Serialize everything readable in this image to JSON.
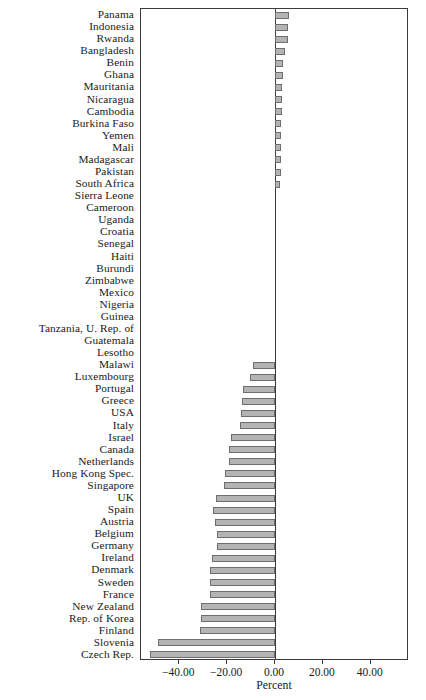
{
  "chart_data": {
    "type": "bar",
    "orientation": "horizontal",
    "title": "",
    "xlabel": "Percent",
    "ylabel": "",
    "xlim": [
      -56,
      56
    ],
    "xticks": [
      -40,
      -20,
      0,
      20,
      40
    ],
    "xticklabels": [
      "−40.00",
      "−20.00",
      "0.00",
      "20.00",
      "40.00"
    ],
    "grid": false,
    "legend": null,
    "bar_color": "#b4b4b4",
    "bar_edge_color": "#6e6e6e",
    "axis_color": "#3a3a3a",
    "categories": [
      "Panama",
      "Indonesia",
      "Rwanda",
      "Bangladesh",
      "Benin",
      "Ghana",
      "Mauritania",
      "Nicaragua",
      "Cambodia",
      "Burkina Faso",
      "Yemen",
      "Mali",
      "Madagascar",
      "Pakistan",
      "South Africa",
      "Sierra Leone",
      "Cameroon",
      "Uganda",
      "Croatia",
      "Senegal",
      "Haiti",
      "Burundi",
      "Zimbabwe",
      "Mexico",
      "Nigeria",
      "Guinea",
      "Tanzania, U. Rep. of",
      "Guatemala",
      "Lesotho",
      "Malawi",
      "Luxembourg",
      "Portugal",
      "Greece",
      "USA",
      "Italy",
      "Israel",
      "Canada",
      "Netherlands",
      "Hong Kong Spec.",
      "Singapore",
      "UK",
      "Spain",
      "Austria",
      "Belgium",
      "Germany",
      "Ireland",
      "Denmark",
      "Sweden",
      "France",
      "New Zealand",
      "Rep. of Korea",
      "Finland",
      "Slovenia",
      "Czech Rep."
    ],
    "values": [
      6.0,
      5.6,
      5.6,
      4.2,
      3.4,
      3.2,
      3.0,
      2.9,
      2.8,
      2.7,
      2.6,
      2.5,
      2.4,
      2.3,
      2.2,
      0.0,
      0.0,
      0.0,
      0.0,
      0.0,
      0.0,
      0.0,
      0.0,
      0.0,
      0.0,
      0.0,
      0.0,
      0.0,
      0.0,
      -9.0,
      -10.6,
      -13.4,
      -14.0,
      -14.4,
      -14.8,
      -18.5,
      -19.2,
      -19.4,
      -20.8,
      -21.2,
      -24.6,
      -26.0,
      -25.0,
      -24.2,
      -24.2,
      -26.4,
      -27.2,
      -27.2,
      -27.2,
      -31.0,
      -31.0,
      -31.2,
      -48.8,
      -52.4
    ]
  }
}
